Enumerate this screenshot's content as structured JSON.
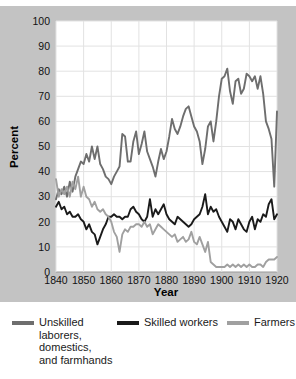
{
  "chart_data": {
    "type": "line",
    "title": "",
    "xlabel": "Year",
    "ylabel": "Percent",
    "xlim": [
      1840,
      1920
    ],
    "ylim": [
      0,
      100
    ],
    "xticks": [
      1840,
      1850,
      1860,
      1870,
      1880,
      1890,
      1900,
      1910,
      1920
    ],
    "yticks": [
      0,
      10,
      20,
      30,
      40,
      50,
      60,
      70,
      80,
      90,
      100
    ],
    "grid": true,
    "legend_position": "below",
    "colors": {
      "unskilled": "#6e6e6e",
      "skilled": "#1a1a1a",
      "farmers": "#a0a0a0",
      "plate": "#c3c3c3",
      "plot_background": "#ffffff",
      "gridline": "#e2e2e2"
    },
    "series": [
      {
        "name": "Unskilled laborers, domestics, and farmhands",
        "color": "#6e6e6e",
        "x": [
          1840,
          1841,
          1842,
          1843,
          1844,
          1845,
          1846,
          1847,
          1848,
          1849,
          1850,
          1851,
          1852,
          1853,
          1854,
          1855,
          1856,
          1857,
          1858,
          1859,
          1860,
          1861,
          1862,
          1863,
          1864,
          1865,
          1866,
          1867,
          1868,
          1869,
          1870,
          1871,
          1872,
          1873,
          1874,
          1875,
          1876,
          1877,
          1878,
          1879,
          1880,
          1881,
          1882,
          1883,
          1884,
          1885,
          1886,
          1887,
          1888,
          1889,
          1890,
          1891,
          1892,
          1893,
          1894,
          1895,
          1896,
          1897,
          1898,
          1899,
          1900,
          1901,
          1902,
          1903,
          1904,
          1905,
          1906,
          1907,
          1908,
          1909,
          1910,
          1911,
          1912,
          1913,
          1914,
          1915,
          1916,
          1917,
          1918,
          1919,
          1920
        ],
        "y": [
          29,
          33,
          31,
          34,
          30,
          36,
          32,
          38,
          41,
          44,
          43,
          47,
          44,
          50,
          45,
          50,
          43,
          41,
          38,
          37,
          35,
          38,
          40,
          42,
          55,
          54,
          44,
          44,
          52,
          56,
          47,
          51,
          56,
          48,
          45,
          42,
          38,
          44,
          49,
          45,
          48,
          54,
          61,
          57,
          55,
          58,
          62,
          65,
          66,
          62,
          58,
          56,
          52,
          43,
          49,
          58,
          60,
          52,
          60,
          70,
          77,
          78,
          81,
          72,
          67,
          76,
          77,
          71,
          73,
          79,
          78,
          76,
          78,
          73,
          78,
          71,
          60,
          57,
          53,
          34,
          64
        ]
      },
      {
        "name": "Skilled workers",
        "color": "#1a1a1a",
        "x": [
          1840,
          1841,
          1842,
          1843,
          1844,
          1845,
          1846,
          1847,
          1848,
          1849,
          1850,
          1851,
          1852,
          1853,
          1854,
          1855,
          1856,
          1857,
          1858,
          1859,
          1860,
          1861,
          1862,
          1863,
          1864,
          1865,
          1866,
          1867,
          1868,
          1869,
          1870,
          1871,
          1872,
          1873,
          1874,
          1875,
          1876,
          1877,
          1878,
          1879,
          1880,
          1881,
          1882,
          1883,
          1884,
          1885,
          1886,
          1887,
          1888,
          1889,
          1890,
          1891,
          1892,
          1893,
          1894,
          1895,
          1896,
          1897,
          1898,
          1899,
          1900,
          1901,
          1902,
          1903,
          1904,
          1905,
          1906,
          1907,
          1908,
          1909,
          1910,
          1911,
          1912,
          1913,
          1914,
          1915,
          1916,
          1917,
          1918,
          1919,
          1920
        ],
        "y": [
          26,
          28,
          25,
          26,
          23,
          24,
          22,
          22,
          23,
          21,
          20,
          17,
          19,
          16,
          15,
          11,
          14,
          17,
          19,
          22,
          22,
          23,
          22,
          22,
          21,
          22,
          22,
          25,
          26,
          24,
          23,
          21,
          20,
          22,
          29,
          22,
          25,
          23,
          25,
          27,
          23,
          21,
          20,
          19,
          22,
          21,
          20,
          19,
          18,
          19,
          21,
          22,
          23,
          26,
          31,
          23,
          26,
          24,
          25,
          22,
          20,
          18,
          16,
          21,
          20,
          17,
          21,
          19,
          17,
          16,
          20,
          22,
          17,
          21,
          20,
          23,
          22,
          27,
          29,
          21,
          23
        ]
      },
      {
        "name": "Farmers",
        "color": "#a0a0a0",
        "x": [
          1840,
          1841,
          1842,
          1843,
          1844,
          1845,
          1846,
          1847,
          1848,
          1849,
          1850,
          1851,
          1852,
          1853,
          1854,
          1855,
          1856,
          1857,
          1858,
          1859,
          1860,
          1861,
          1862,
          1863,
          1864,
          1865,
          1866,
          1867,
          1868,
          1869,
          1870,
          1871,
          1872,
          1873,
          1874,
          1875,
          1876,
          1877,
          1878,
          1879,
          1880,
          1881,
          1882,
          1883,
          1884,
          1885,
          1886,
          1887,
          1888,
          1889,
          1890,
          1891,
          1892,
          1893,
          1894,
          1895,
          1896,
          1897,
          1898,
          1899,
          1900,
          1901,
          1902,
          1903,
          1904,
          1905,
          1906,
          1907,
          1908,
          1909,
          1910,
          1911,
          1912,
          1913,
          1914,
          1915,
          1916,
          1917,
          1918,
          1919,
          1920
        ],
        "y": [
          37,
          30,
          33,
          31,
          34,
          30,
          36,
          33,
          38,
          30,
          34,
          30,
          29,
          26,
          28,
          25,
          24,
          25,
          23,
          22,
          20,
          16,
          14,
          8,
          15,
          17,
          16,
          18,
          18,
          19,
          19,
          18,
          20,
          18,
          19,
          15,
          17,
          19,
          18,
          17,
          16,
          15,
          14,
          15,
          12,
          13,
          14,
          12,
          13,
          16,
          12,
          11,
          14,
          11,
          8,
          12,
          4,
          3,
          2,
          2,
          2,
          2,
          3,
          2,
          3,
          2,
          3,
          2,
          3,
          2,
          3,
          2,
          2,
          3,
          3,
          2,
          4,
          5,
          5,
          5,
          6
        ]
      }
    ]
  },
  "legend": {
    "entries": [
      {
        "label": "Unskilled\nlaborers,\ndomestics,\nand farmhands",
        "color": "#6e6e6e"
      },
      {
        "label": "Skilled workers",
        "color": "#1a1a1a"
      },
      {
        "label": "Farmers",
        "color": "#a0a0a0"
      }
    ]
  }
}
